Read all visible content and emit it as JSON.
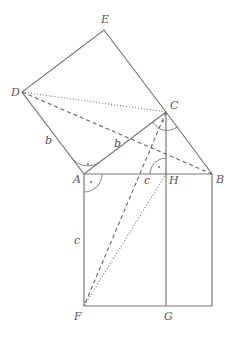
{
  "diagram": {
    "points": {
      "A": {
        "label": "A",
        "x": 84,
        "y": 174
      },
      "B": {
        "label": "B",
        "x": 212,
        "y": 174
      },
      "C": {
        "label": "C",
        "x": 166,
        "y": 112
      },
      "D": {
        "label": "D",
        "x": 22,
        "y": 92
      },
      "E": {
        "label": "E",
        "x": 104,
        "y": 30
      },
      "F": {
        "label": "F",
        "x": 84,
        "y": 306
      },
      "G": {
        "label": "G",
        "x": 166,
        "y": 306
      },
      "H": {
        "label": "H",
        "x": 166,
        "y": 174
      }
    },
    "side_labels": {
      "b_left": "b",
      "b_diag": "b",
      "c_top": "c",
      "c_left": "c"
    },
    "line_styles": {
      "solid": [
        "A-B",
        "B-C",
        "C-A",
        "A-D",
        "D-E",
        "E-C",
        "A-F",
        "F-G",
        "G-B-bottom",
        "B-bottom",
        "C-G"
      ],
      "dashed": [
        "D-B",
        "C-F"
      ],
      "dotted": [
        "D-C",
        "H-F"
      ]
    },
    "colors": {
      "stroke": "#777777",
      "text": "#555555",
      "background": "#ffffff"
    }
  }
}
